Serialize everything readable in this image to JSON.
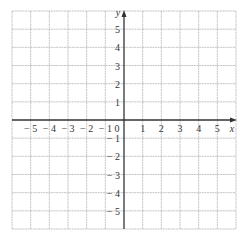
{
  "chart_data": {
    "type": "scatter",
    "title": "",
    "xlabel": "x",
    "ylabel": "y",
    "xlim": [
      -6,
      6
    ],
    "ylim": [
      -6,
      6
    ],
    "grid": true,
    "x_ticks": [
      -5,
      -4,
      -3,
      -2,
      -1,
      0,
      1,
      2,
      3,
      4,
      5
    ],
    "y_ticks": [
      5,
      4,
      3,
      2,
      1,
      -1,
      -2,
      -3,
      -4,
      -5
    ],
    "x_tick_labels": [
      "− 5",
      "− 4",
      "− 3",
      "− 2",
      "− 1",
      "0",
      "1",
      "2",
      "3",
      "4",
      "5"
    ],
    "y_tick_labels": [
      "5",
      "4",
      "3",
      "2",
      "1",
      "− 1",
      "− 2",
      "− 3",
      "− 4",
      "− 5"
    ],
    "series": []
  },
  "colors": {
    "grid": "#b8b8b8",
    "axis": "#333333",
    "background": "#ffffff"
  }
}
